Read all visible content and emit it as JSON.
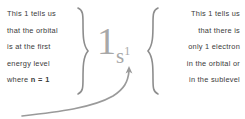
{
  "figure": {
    "topic": "electron configuration notation 1s1",
    "colors": {
      "background": "#ffffff",
      "text": "#3a3a3a",
      "brace": "#8d8d8d",
      "notation": "#a8a8a8",
      "arrow": "#9a9a9a"
    }
  },
  "left_note": {
    "lines": [
      "This 1 tells us",
      "that the orbital",
      "is at the first",
      "energy level"
    ],
    "last_line_prefix": "where ",
    "last_line_emphasis": "n = 1"
  },
  "right_note": {
    "lines": [
      "This 1 tells us",
      "that there is",
      "only 1 electron",
      "in the orbital or",
      "in the sublevel"
    ]
  },
  "notation": {
    "principal_number": "1",
    "sublevel_letter": "s",
    "electron_count": "1",
    "full": "1s1"
  },
  "braces": {
    "left_glyph": "}",
    "right_glyph": "{"
  },
  "arrow": {
    "label": "curved-arrow-to-superscript"
  }
}
